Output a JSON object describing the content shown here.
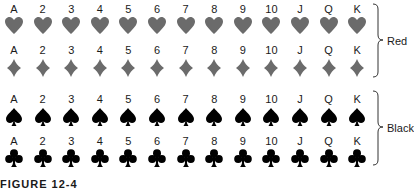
{
  "ranks": [
    "A",
    "2",
    "3",
    "4",
    "5",
    "6",
    "7",
    "8",
    "9",
    "10",
    "J",
    "Q",
    "K"
  ],
  "rows": [
    {
      "suit": "hearts",
      "icon": "heart-icon",
      "color": "#6b6b6b",
      "label_y": 3,
      "suit_y": 16
    },
    {
      "suit": "diamonds",
      "icon": "diamond-icon",
      "color": "#6b6b6b",
      "label_y": 44,
      "suit_y": 58
    },
    {
      "suit": "spades",
      "icon": "spade-icon",
      "color": "#000000",
      "label_y": 93,
      "suit_y": 107
    },
    {
      "suit": "clubs",
      "icon": "club-icon",
      "color": "#000000",
      "label_y": 135,
      "suit_y": 148
    }
  ],
  "groups": [
    {
      "label": "Red",
      "top": 3,
      "bottom": 77
    },
    {
      "label": "Black",
      "top": 90,
      "bottom": 165
    }
  ],
  "caption": "FIGURE 12-4"
}
